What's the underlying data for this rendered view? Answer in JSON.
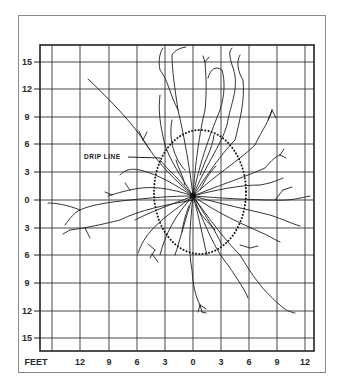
{
  "figure": {
    "unit_label": "FEET",
    "annotation": "DRIP LINE",
    "y_axis_labels": [
      "15",
      "12",
      "9",
      "6",
      "3",
      "0",
      "3",
      "6",
      "9",
      "12",
      "15"
    ],
    "x_axis_labels": [
      "12",
      "9",
      "6",
      "3",
      "0",
      "3",
      "6",
      "9",
      "12"
    ],
    "grid_spacing_feet": 3,
    "colors": {
      "ink": "#222222",
      "grid": "#333333",
      "frame": "#8a8a8a",
      "background": "#ffffff"
    }
  }
}
